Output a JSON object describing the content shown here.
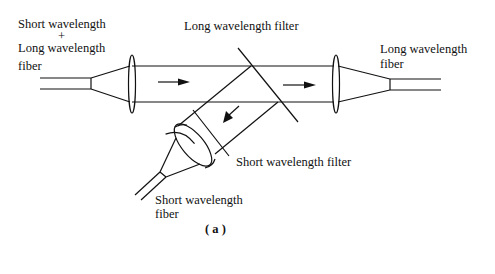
{
  "figure": {
    "caption": "( a )",
    "labels": {
      "input_line1": "Short wavelength",
      "input_plus": "+",
      "input_line2": "Long wavelength",
      "input_line3": "fiber",
      "long_filter": "Long wavelength filter",
      "long_output_line1": "Long wavelength",
      "long_output_line2": "fiber",
      "short_filter": "Short wavelength filter",
      "short_output_line1": "Short wavelength",
      "short_output_line2": "fiber"
    }
  }
}
